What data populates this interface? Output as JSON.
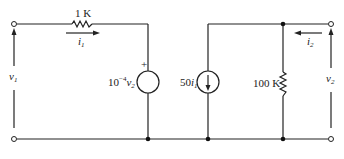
{
  "diagram": {
    "type": "two-port small-signal circuit",
    "left_port": {
      "voltage_label": "v",
      "voltage_sub": "1",
      "current_label": "i",
      "current_sub": "1",
      "resistor_label": "1 K",
      "dependent_voltage_source": {
        "coef": "10",
        "exp": "−4",
        "var": "v",
        "var_sub": "2",
        "polarity": "+"
      }
    },
    "right_port": {
      "voltage_label": "v",
      "voltage_sub": "2",
      "current_label": "i",
      "current_sub": "2",
      "dependent_current_source": {
        "coef": "50",
        "var": "i",
        "var_sub": "1"
      },
      "resistor_label": "100 K"
    }
  }
}
